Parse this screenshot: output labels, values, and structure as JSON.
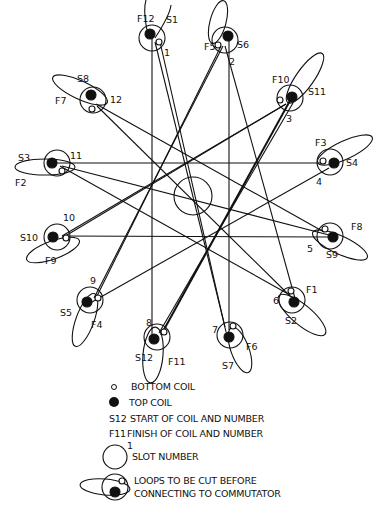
{
  "colors": {
    "ink": "#111111",
    "paper": "#ffffff"
  },
  "slots": [
    {
      "number": "1",
      "cx": 152,
      "cy": 38,
      "start": "S1",
      "finish": "F12"
    },
    {
      "number": "2",
      "cx": 225,
      "cy": 40,
      "start": "S6",
      "finish": "F5"
    },
    {
      "number": "3",
      "cx": 290,
      "cy": 100,
      "start": "S11",
      "finish": "F10"
    },
    {
      "number": "4",
      "cx": 330,
      "cy": 162,
      "start": "S4",
      "finish": "F3"
    },
    {
      "number": "5",
      "cx": 330,
      "cy": 236,
      "start": "S9",
      "finish": "F8"
    },
    {
      "number": "6",
      "cx": 292,
      "cy": 300,
      "start": "S2",
      "finish": "F1"
    },
    {
      "number": "7",
      "cx": 230,
      "cy": 335,
      "start": "S7",
      "finish": "F6"
    },
    {
      "number": "8",
      "cx": 157,
      "cy": 337,
      "start": "S12",
      "finish": "F11"
    },
    {
      "number": "9",
      "cx": 90,
      "cy": 300,
      "start": "S5",
      "finish": "F4"
    },
    {
      "number": "10",
      "cx": 57,
      "cy": 237,
      "start": "S10",
      "finish": "F9"
    },
    {
      "number": "11",
      "cx": 57,
      "cy": 163,
      "start": "S3",
      "finish": "F2"
    },
    {
      "number": "12",
      "cx": 93,
      "cy": 100,
      "start": "S8",
      "finish": "F7"
    }
  ],
  "labels": {
    "slot": [
      "1",
      "2",
      "3",
      "4",
      "5",
      "6",
      "7",
      "8",
      "9",
      "10",
      "11",
      "12"
    ],
    "S1": "S1",
    "F12": "F12",
    "S6": "S6",
    "F5": "F5",
    "S11": "S11",
    "F10": "F10",
    "S4": "S4",
    "F3": "F3",
    "S9": "S9",
    "F8": "F8",
    "S2": "S2",
    "F1": "F1",
    "S7": "S7",
    "F6": "F6",
    "S12": "S12",
    "F11": "F11",
    "S5": "S5",
    "F4": "F4",
    "S10": "S10",
    "F9": "F9",
    "S3": "S3",
    "F2": "F2",
    "S8": "S8",
    "F7": "F7"
  },
  "legend": {
    "bottom_coil": "BOTTOM COIL",
    "top_coil": "TOP COIL",
    "start_symbol": "S12",
    "start_desc": "START OF COIL AND NUMBER",
    "finish_symbol": "F11",
    "finish_desc": "FINISH OF COIL AND NUMBER",
    "slot_num_example": "1",
    "slot_number": "SLOT NUMBER",
    "loops_line1": "LOOPS TO BE CUT BEFORE",
    "loops_line2": "CONNECTING TO COMMUTATOR"
  }
}
